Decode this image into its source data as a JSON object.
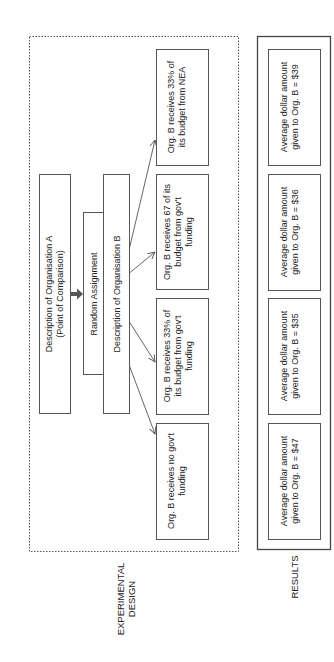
{
  "diagram": {
    "orientation": "rotated-90-ccw",
    "colors": {
      "stroke": "#555555",
      "text": "#222222",
      "background": "#ffffff"
    },
    "sections": {
      "experimental_design": {
        "label_line1": "EXPERIMENTAL",
        "label_line2": "DESIGN"
      },
      "results": {
        "label": "RESULTS"
      }
    },
    "org_a": {
      "line1": "Description of Organisation A",
      "line2": "(Point of Comparison)"
    },
    "random_assignment": {
      "label": "Random Assignment"
    },
    "org_b": {
      "label": "Description of Organisation B"
    },
    "conditions": [
      {
        "line1": "Org. B receives no gov't",
        "line2": "funding",
        "line3": ""
      },
      {
        "line1": "Org. B receives 33% of",
        "line2": "its budget from gov't",
        "line3": "funding"
      },
      {
        "line1": "Org. B receives 67 of its",
        "line2": "budget from gov't",
        "line3": "funding"
      },
      {
        "line1": "Org. B receives 33% of",
        "line2": "its budget from NEA",
        "line3": ""
      }
    ],
    "results": [
      {
        "line1": "Average dollar amount",
        "line2": "given to Org. B = $47"
      },
      {
        "line1": "Average dollar amount",
        "line2": "given to Org. B = $35"
      },
      {
        "line1": "Average dollar amount",
        "line2": "given to Org. B = $36"
      },
      {
        "line1": "Average dollar amount",
        "line2": "given to Org. B = $39"
      }
    ]
  }
}
